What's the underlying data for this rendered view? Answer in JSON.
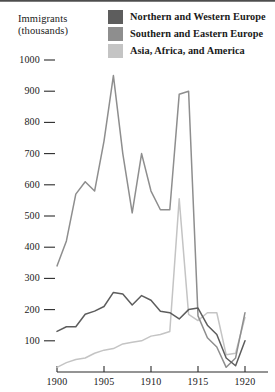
{
  "axis_title": "Immigrants\n(thousands)",
  "legend": {
    "items": [
      {
        "label": "Northern and Western Europe",
        "color": "#5d5d5d",
        "swatch_name": "legend-swatch-northern-western-europe"
      },
      {
        "label": "Southern and Eastern Europe",
        "color": "#8e8e8e",
        "swatch_name": "legend-swatch-southern-eastern-europe"
      },
      {
        "label": "Asia, Africa, and America",
        "color": "#c4c4c4",
        "swatch_name": "legend-swatch-asia-africa-america"
      }
    ]
  },
  "chart_data": {
    "type": "line",
    "title": "Immigrants (thousands)",
    "xlabel": "",
    "ylabel": "Immigrants (thousands)",
    "xlim": [
      1900,
      1920
    ],
    "ylim": [
      0,
      1000
    ],
    "grid": false,
    "legend_position": "top-right",
    "y_ticks": [
      100,
      200,
      300,
      400,
      500,
      600,
      700,
      800,
      900,
      1000
    ],
    "x_ticks": [
      1900,
      1905,
      1910,
      1915,
      1920
    ],
    "x": [
      1900,
      1901,
      1902,
      1903,
      1904,
      1905,
      1906,
      1907,
      1908,
      1909,
      1910,
      1911,
      1912,
      1913,
      1914,
      1915,
      1916,
      1917,
      1918,
      1919,
      1920
    ],
    "series": [
      {
        "name": "Northern and Western Europe",
        "color": "#5d5d5d",
        "values": [
          130,
          145,
          145,
          185,
          195,
          210,
          255,
          250,
          215,
          245,
          230,
          195,
          190,
          170,
          200,
          205,
          150,
          120,
          45,
          20,
          100
        ]
      },
      {
        "name": "Southern and Eastern Europe",
        "color": "#8e8e8e",
        "values": [
          340,
          420,
          570,
          610,
          580,
          740,
          950,
          700,
          510,
          700,
          580,
          520,
          520,
          890,
          900,
          180,
          110,
          80,
          15,
          45,
          190
        ]
      },
      {
        "name": "Asia, Africa, and America",
        "color": "#c4c4c4",
        "values": [
          15,
          30,
          40,
          45,
          60,
          70,
          75,
          90,
          95,
          100,
          115,
          120,
          130,
          555,
          185,
          165,
          190,
          190,
          55,
          60,
          175
        ]
      }
    ]
  }
}
